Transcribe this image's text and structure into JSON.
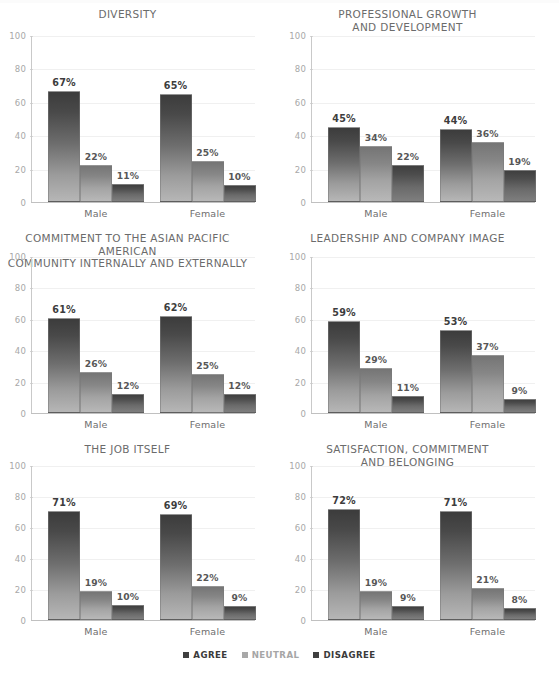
{
  "page": {
    "background": "#ffffff",
    "legend": {
      "items": [
        {
          "label": "AGREE",
          "color": "#3f3f3f",
          "style": "dark"
        },
        {
          "label": "NEUTRAL",
          "color": "#a8a8a8",
          "style": "light"
        },
        {
          "label": "DISAGREE",
          "color": "#3f3f3f",
          "style": "dark"
        }
      ]
    }
  },
  "chart_data": [
    {
      "type": "bar",
      "title": "DIVERSITY",
      "categories": [
        "Male",
        "Female"
      ],
      "series": [
        {
          "name": "AGREE",
          "values": [
            67,
            65
          ],
          "labels": [
            "67%",
            "65%"
          ]
        },
        {
          "name": "NEUTRAL",
          "values": [
            22,
            25
          ],
          "labels": [
            "22%",
            "25%"
          ]
        },
        {
          "name": "DISAGREE",
          "values": [
            11,
            10
          ],
          "labels": [
            "11%",
            "10%"
          ]
        }
      ],
      "xlabel": "",
      "ylabel": "",
      "ylim": [
        0,
        100
      ],
      "yticks": [
        0,
        20,
        40,
        60,
        80,
        100
      ],
      "grid": true,
      "legend_position": "bottom"
    },
    {
      "type": "bar",
      "title": "PROFESSIONAL GROWTH\nAND DEVELOPMENT",
      "categories": [
        "Male",
        "Female"
      ],
      "series": [
        {
          "name": "AGREE",
          "values": [
            45,
            44
          ],
          "labels": [
            "45%",
            "44%"
          ]
        },
        {
          "name": "NEUTRAL",
          "values": [
            34,
            36
          ],
          "labels": [
            "34%",
            "36%"
          ]
        },
        {
          "name": "DISAGREE",
          "values": [
            22,
            19
          ],
          "labels": [
            "22%",
            "19%"
          ]
        }
      ],
      "xlabel": "",
      "ylabel": "",
      "ylim": [
        0,
        100
      ],
      "yticks": [
        0,
        20,
        40,
        60,
        80,
        100
      ],
      "grid": true,
      "legend_position": "bottom"
    },
    {
      "type": "bar",
      "title": "COMMITMENT TO THE ASIAN PACIFIC AMERICAN\nCOMMUNITY INTERNALLY AND EXTERNALLY",
      "categories": [
        "Male",
        "Female"
      ],
      "series": [
        {
          "name": "AGREE",
          "values": [
            61,
            62
          ],
          "labels": [
            "61%",
            "62%"
          ]
        },
        {
          "name": "NEUTRAL",
          "values": [
            26,
            25
          ],
          "labels": [
            "26%",
            "25%"
          ]
        },
        {
          "name": "DISAGREE",
          "values": [
            12,
            12
          ],
          "labels": [
            "12%",
            "12%"
          ]
        }
      ],
      "xlabel": "",
      "ylabel": "",
      "ylim": [
        0,
        100
      ],
      "yticks": [
        0,
        20,
        40,
        60,
        80,
        100
      ],
      "grid": true,
      "legend_position": "bottom"
    },
    {
      "type": "bar",
      "title": "LEADERSHIP AND COMPANY IMAGE",
      "categories": [
        "Male",
        "Female"
      ],
      "series": [
        {
          "name": "AGREE",
          "values": [
            59,
            53
          ],
          "labels": [
            "59%",
            "53%"
          ]
        },
        {
          "name": "NEUTRAL",
          "values": [
            29,
            37
          ],
          "labels": [
            "29%",
            "37%"
          ]
        },
        {
          "name": "DISAGREE",
          "values": [
            11,
            9
          ],
          "labels": [
            "11%",
            "9%"
          ]
        }
      ],
      "xlabel": "",
      "ylabel": "",
      "ylim": [
        0,
        100
      ],
      "yticks": [
        0,
        20,
        40,
        60,
        80,
        100
      ],
      "grid": true,
      "legend_position": "bottom"
    },
    {
      "type": "bar",
      "title": "THE JOB ITSELF",
      "categories": [
        "Male",
        "Female"
      ],
      "series": [
        {
          "name": "AGREE",
          "values": [
            71,
            69
          ],
          "labels": [
            "71%",
            "69%"
          ]
        },
        {
          "name": "NEUTRAL",
          "values": [
            19,
            22
          ],
          "labels": [
            "19%",
            "22%"
          ]
        },
        {
          "name": "DISAGREE",
          "values": [
            10,
            9
          ],
          "labels": [
            "10%",
            "9%"
          ]
        }
      ],
      "xlabel": "",
      "ylabel": "",
      "ylim": [
        0,
        100
      ],
      "yticks": [
        0,
        20,
        40,
        60,
        80,
        100
      ],
      "grid": true,
      "legend_position": "bottom"
    },
    {
      "type": "bar",
      "title": "SATISFACTION, COMMITMENT\nAND BELONGING",
      "categories": [
        "Male",
        "Female"
      ],
      "series": [
        {
          "name": "AGREE",
          "values": [
            72,
            71
          ],
          "labels": [
            "72%",
            "71%"
          ]
        },
        {
          "name": "NEUTRAL",
          "values": [
            19,
            21
          ],
          "labels": [
            "19%",
            "21%"
          ]
        },
        {
          "name": "DISAGREE",
          "values": [
            9,
            8
          ],
          "labels": [
            "9%",
            "8%"
          ]
        }
      ],
      "xlabel": "",
      "ylabel": "",
      "ylim": [
        0,
        100
      ],
      "yticks": [
        0,
        20,
        40,
        60,
        80,
        100
      ],
      "grid": true,
      "legend_position": "bottom"
    }
  ]
}
